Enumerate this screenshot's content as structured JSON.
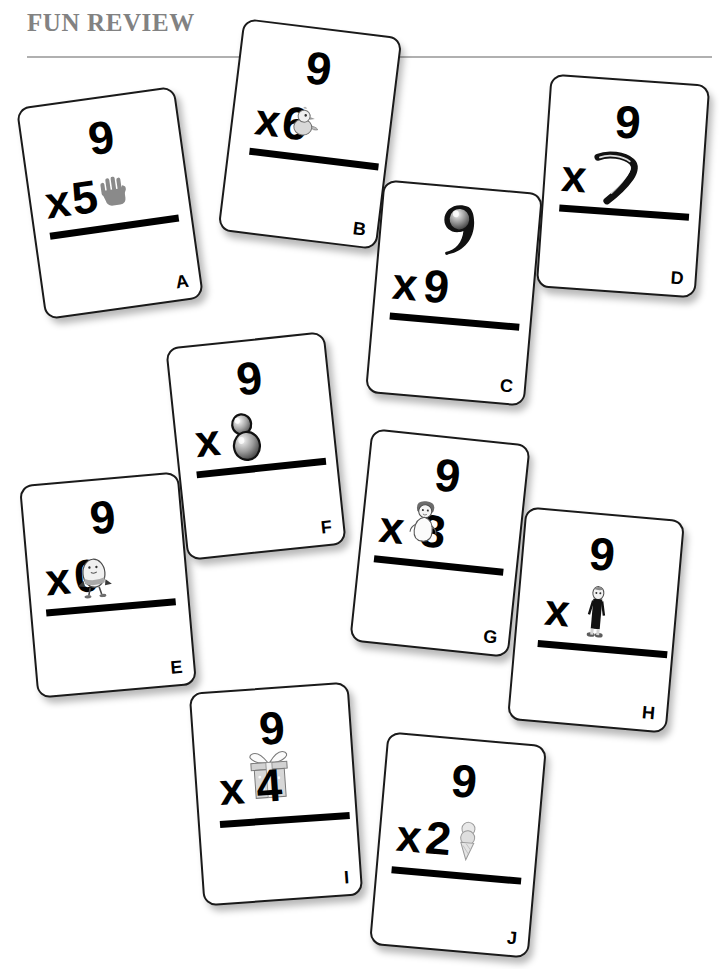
{
  "header": {
    "title": "FUN REVIEW",
    "rule_color": "#b0b0b0",
    "title_color": "#828282"
  },
  "cards": [
    {
      "letter": "A",
      "top_operand": "9",
      "operator": "x",
      "bottom_operand": "5",
      "picture": "hand-icon",
      "picture_position": "right",
      "expression": "9 x 5",
      "x": 30,
      "y": 96,
      "rotation": -8
    },
    {
      "letter": "B",
      "top_operand": "9",
      "operator": "x",
      "bottom_operand": "6",
      "picture": "chick-icon",
      "picture_position": "overlap",
      "expression": "9 x 6",
      "x": 230,
      "y": 27,
      "rotation": 7
    },
    {
      "letter": "C",
      "top_operand": "9",
      "operator": "x",
      "bottom_operand": "9",
      "picture": "balloon-nine-icon",
      "picture_position": "top-replaces-digit",
      "expression": "9 x 9",
      "x": 374,
      "y": 186,
      "rotation": 5
    },
    {
      "letter": "D",
      "top_operand": "9",
      "operator": "x",
      "bottom_operand": "7",
      "picture": "boomerang-seven-icon",
      "picture_position": "bottom-replaces-digit",
      "expression": "9 x 7",
      "x": 543,
      "y": 79,
      "rotation": 4
    },
    {
      "letter": "E",
      "top_operand": "9",
      "operator": "x",
      "bottom_operand": "0",
      "picture": "humpty-dumpty-icon",
      "picture_position": "overlap",
      "expression": "9 x 0",
      "x": 28,
      "y": 478,
      "rotation": -5
    },
    {
      "letter": "F",
      "top_operand": "9",
      "operator": "x",
      "bottom_operand": "8",
      "picture": "snowman-eight-icon",
      "picture_position": "bottom-replaces-digit",
      "expression": "9 x 8",
      "x": 176,
      "y": 339,
      "rotation": -6
    },
    {
      "letter": "G",
      "top_operand": "9",
      "operator": "x",
      "bottom_operand": "3",
      "picture": "doll-icon",
      "picture_position": "overlap",
      "expression": "9 x 3",
      "x": 360,
      "y": 436,
      "rotation": 6
    },
    {
      "letter": "H",
      "top_operand": "9",
      "operator": "x",
      "bottom_operand": "1",
      "picture": "standing-figure-icon",
      "picture_position": "bottom-replaces-digit",
      "expression": "9 x 1",
      "x": 516,
      "y": 513,
      "rotation": 5
    },
    {
      "letter": "I",
      "top_operand": "9",
      "operator": "x",
      "bottom_operand": "4",
      "picture": "gift-box-icon",
      "picture_position": "overlap",
      "expression": "9 x 4",
      "x": 196,
      "y": 687,
      "rotation": -4
    },
    {
      "letter": "J",
      "top_operand": "9",
      "operator": "x",
      "bottom_operand": "2",
      "picture": "ice-cream-cone-icon",
      "picture_position": "right",
      "expression": "9 x 2",
      "x": 378,
      "y": 738,
      "rotation": 5
    }
  ]
}
